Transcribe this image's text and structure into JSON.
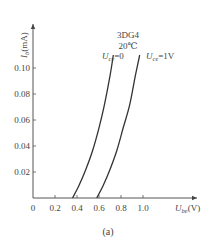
{
  "chart_data": {
    "type": "line",
    "title": "",
    "xlabel": "U_be(V)",
    "ylabel": "I_b(mA)",
    "xlabel_main": "U",
    "xlabel_sub": "be",
    "xlabel_unit": "(V)",
    "ylabel_main": "I",
    "ylabel_sub": "b",
    "ylabel_unit": "(mA)",
    "xlim": [
      0,
      1.2
    ],
    "ylim": [
      0,
      0.12
    ],
    "x_ticks": [
      "0",
      "0.2",
      "0.4",
      "0.6",
      "0.8",
      "1.0"
    ],
    "y_ticks": [
      "0.02",
      "0.04",
      "0.06",
      "0.08",
      "0.10"
    ],
    "grid": false,
    "legend": "none",
    "annotations": {
      "device": "3DG4",
      "temperature": "20℃"
    },
    "series": [
      {
        "name": "U_ce=0",
        "label_main": "U",
        "label_sub": "ce",
        "label_value": "=0",
        "x": [
          0.36,
          0.42,
          0.48,
          0.54,
          0.6,
          0.65,
          0.7,
          0.73
        ],
        "y": [
          0.0,
          0.01,
          0.022,
          0.036,
          0.054,
          0.072,
          0.094,
          0.11
        ]
      },
      {
        "name": "U_ce=1V",
        "label_main": "U",
        "label_sub": "ce",
        "label_value": "=1V",
        "x": [
          0.58,
          0.64,
          0.7,
          0.76,
          0.82,
          0.88,
          0.93,
          0.97
        ],
        "y": [
          0.0,
          0.01,
          0.022,
          0.036,
          0.054,
          0.072,
          0.094,
          0.11
        ]
      }
    ],
    "caption": "(a)"
  }
}
